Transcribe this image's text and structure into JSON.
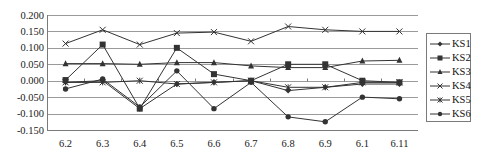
{
  "chart_data": {
    "type": "line",
    "title": "",
    "xlabel": "",
    "ylabel": "",
    "categories": [
      "6.2",
      "6.3",
      "6.4",
      "6.5",
      "6.6",
      "6.7",
      "6.8",
      "6.9",
      "6.1",
      "6.11"
    ],
    "ylim": [
      -0.15,
      0.2
    ],
    "yticks": [
      "0.200",
      "0.150",
      "0.100",
      "0.050",
      "0.000",
      "-0.050",
      "-0.100",
      "-0.150"
    ],
    "ytick_values": [
      0.2,
      0.15,
      0.1,
      0.05,
      0.0,
      -0.05,
      -0.1,
      -0.15
    ],
    "grid": true,
    "legend_position": "right",
    "series": [
      {
        "name": "KS1",
        "marker": "diamond",
        "values": [
          -0.005,
          0.0,
          -0.085,
          -0.01,
          -0.005,
          0.0,
          -0.03,
          -0.02,
          -0.01,
          -0.01
        ]
      },
      {
        "name": "KS2",
        "marker": "square",
        "values": [
          0.002,
          0.11,
          -0.085,
          0.1,
          0.02,
          0.0,
          0.05,
          0.05,
          0.0,
          -0.005
        ]
      },
      {
        "name": "KS3",
        "marker": "triangle",
        "values": [
          0.052,
          0.052,
          0.05,
          0.055,
          0.055,
          0.045,
          0.04,
          0.04,
          0.06,
          0.062
        ]
      },
      {
        "name": "KS4",
        "marker": "x",
        "values": [
          0.113,
          0.155,
          0.11,
          0.145,
          0.148,
          0.12,
          0.165,
          0.155,
          0.15,
          0.15
        ]
      },
      {
        "name": "KS5",
        "marker": "star",
        "values": [
          -0.005,
          -0.005,
          0.0,
          -0.01,
          -0.005,
          0.0,
          -0.02,
          -0.02,
          -0.005,
          -0.005
        ]
      },
      {
        "name": "KS6",
        "marker": "circle",
        "values": [
          -0.025,
          0.005,
          -0.08,
          0.03,
          -0.085,
          -0.005,
          -0.11,
          -0.125,
          -0.05,
          -0.055
        ]
      }
    ]
  },
  "colors": {
    "line": "#333333",
    "grid": "#9a9a9a",
    "axis": "#7a7a7a",
    "background": "#ffffff"
  }
}
